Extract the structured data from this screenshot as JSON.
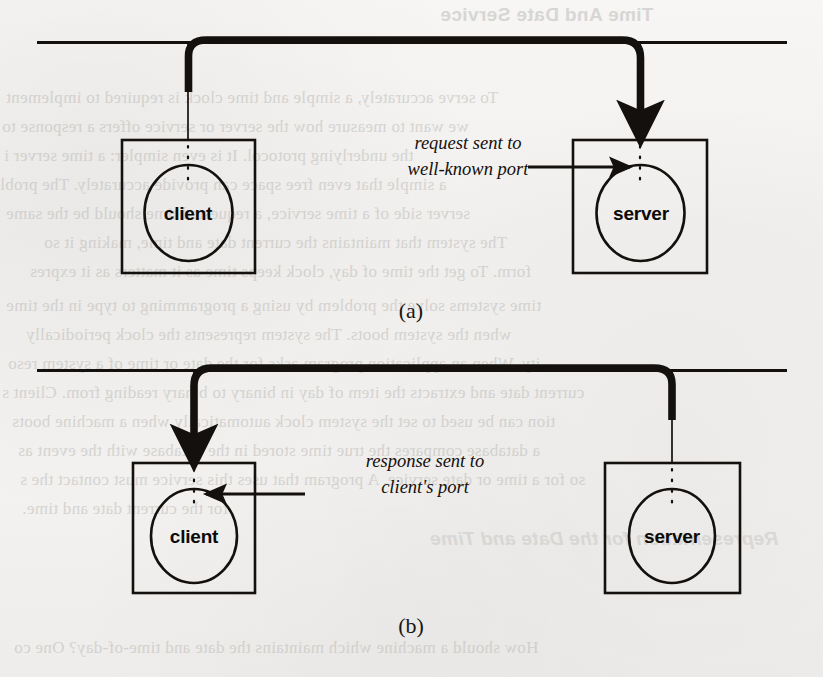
{
  "figure": {
    "panels": [
      {
        "id": "a",
        "label": "(a)",
        "annotation_line1": "request sent to",
        "annotation_line2": "well-known port",
        "source_node": "client",
        "target_node": "server",
        "client_label": "client",
        "server_label": "server",
        "arrow_direction": "client-to-server"
      },
      {
        "id": "b",
        "label": "(b)",
        "annotation_line1": "response sent to",
        "annotation_line2": "client's port",
        "source_node": "server",
        "target_node": "client",
        "client_label": "client",
        "server_label": "server",
        "arrow_direction": "server-to-client"
      }
    ]
  },
  "background_text": {
    "heading": "Time And Date Service",
    "lines": [
      "To serve accurately, a simple and time clock is required to implement",
      "we want to measure how the server or service offers a response to",
      "the underlying protocol. It is even simpler: a time server i",
      "a simple that even free space can provide accurately. The probl",
      "server side of a time service, a requested time should be the same",
      "The system that maintains the current date and time, making it so",
      "form.  To get the time of day, clock keeps time as it matters as it expres",
      "time systems solve the problem by using a programming to type in the time",
      "when the system boots.  The system represents the clock periodically",
      "ity.  When an application program asks for the date or time of a system reso",
      "current date and extracts the item of day in binary to binary reading from.  Client s",
      "tion can be used to set the system clock automatically when a machine boots",
      "a database compares the true time stored in the database with the event as",
      "so for a time or date service.  A program that uses this service must contact the s",
      "for the current date and time.",
      "Representation for the Date and Time",
      "How should a machine which maintains the date and time-of-day?  One co"
    ]
  },
  "colors": {
    "ink": "#14100d",
    "paper": "#f4f3f1",
    "ghost": "#b9b7b4"
  },
  "icons": {
    "network_bus": "network-bus-line",
    "thick_arrow": "message-flow-arrow",
    "thin_arrow": "port-pointer-arrow",
    "port_marker": "dotted-port-marker"
  }
}
